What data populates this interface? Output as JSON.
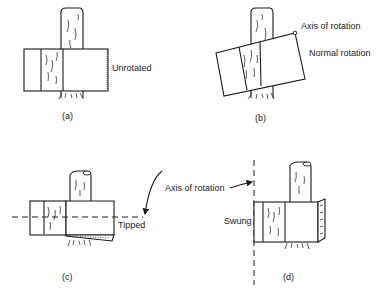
{
  "figure": {
    "panels": [
      {
        "id": "a",
        "caption": "(a)",
        "label": "Unrotated"
      },
      {
        "id": "b",
        "caption": "(b)",
        "label": "Normal rotation",
        "axis_label": "Axis of rotation"
      },
      {
        "id": "c",
        "caption": "(c)",
        "label": "Tipped"
      },
      {
        "id": "d",
        "caption": "(d)",
        "label": "Swung"
      }
    ],
    "shared_axis_label": "Axis of rotation"
  }
}
